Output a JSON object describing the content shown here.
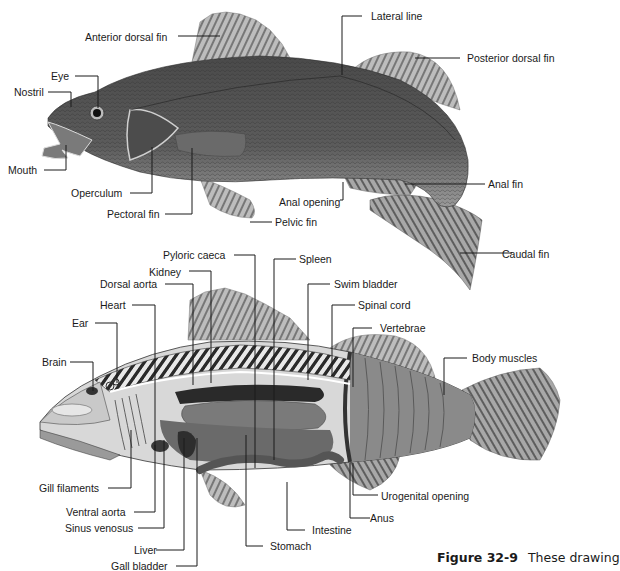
{
  "figure": {
    "caption_number": "Figure 32-9",
    "caption_text": "These drawing"
  },
  "colors": {
    "background": "#ffffff",
    "fish_body": "#5a5a5a",
    "fish_dark": "#3a3a3a",
    "fin": "#9a9a9a",
    "leader_line": "#1a1a1a"
  },
  "external_view": {
    "labels": {
      "anterior_dorsal_fin": "Anterior dorsal fin",
      "lateral_line": "Lateral line",
      "posterior_dorsal_fin": "Posterior dorsal fin",
      "eye": "Eye",
      "nostril": "Nostril",
      "mouth": "Mouth",
      "operculum": "Operculum",
      "pectoral_fin": "Pectoral fin",
      "anal_opening": "Anal opening",
      "pelvic_fin": "Pelvic fin",
      "anal_fin": "Anal fin",
      "caudal_fin": "Caudal fin"
    }
  },
  "internal_view": {
    "labels": {
      "pyloric_caeca": "Pyloric caeca",
      "spleen": "Spleen",
      "kidney": "Kidney",
      "swim_bladder": "Swim bladder",
      "dorsal_aorta": "Dorsal aorta",
      "heart": "Heart",
      "spinal_cord": "Spinal cord",
      "ear": "Ear",
      "vertebrae": "Vertebrae",
      "brain": "Brain",
      "body_muscles": "Body muscles",
      "gill_filaments": "Gill filaments",
      "ventral_aorta": "Ventral aorta",
      "sinus_venosus": "Sinus venosus",
      "liver": "Liver",
      "gall_bladder": "Gall bladder",
      "stomach": "Stomach",
      "intestine": "Intestine",
      "urogenital_opening": "Urogenital opening",
      "anus": "Anus"
    }
  }
}
